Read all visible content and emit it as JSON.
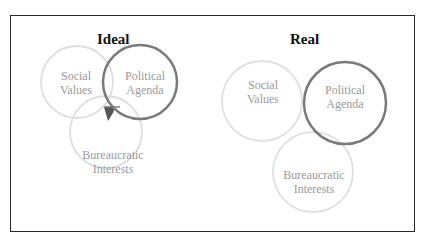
{
  "diagrams": [
    {
      "title": "Ideal",
      "circles": [
        {
          "label_line1": "Social",
          "label_line2": "Values"
        },
        {
          "label_line1": "Political",
          "label_line2": "Agenda"
        },
        {
          "label_line1": "Bureaucratic",
          "label_line2": "Interests"
        }
      ]
    },
    {
      "title": "Real",
      "circles": [
        {
          "label_line1": "Social",
          "label_line2": "Values"
        },
        {
          "label_line1": "Political",
          "label_line2": "Agenda"
        },
        {
          "label_line1": "Bureaucratic",
          "label_line2": "Interests"
        }
      ]
    }
  ],
  "colors": {
    "light_circle": "#dcdcdc",
    "political_circle": "#777777",
    "intersection_fill": "#555555",
    "label_text": "#9a9a9a"
  }
}
